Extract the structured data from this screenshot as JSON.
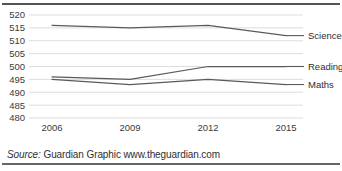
{
  "figure": {
    "source_prefix": "Source:",
    "source_text": "Guardian Graphic www.theguardian.com",
    "line_color": "#5a5a5a",
    "grid_color": "#d9d9d9",
    "rule_color": "#555555"
  },
  "chart_data": {
    "type": "line",
    "title": "",
    "subtitle": "",
    "xlabel": "",
    "ylabel": "",
    "x": [
      2006,
      2009,
      2012,
      2015
    ],
    "categories": [
      "2006",
      "2009",
      "2012",
      "2015"
    ],
    "ylim": [
      480,
      520
    ],
    "yticks": [
      480,
      485,
      490,
      495,
      500,
      505,
      510,
      515,
      520
    ],
    "ytick_labels": [
      "480",
      "485",
      "490",
      "495",
      "500",
      "505",
      "510",
      "515",
      "520"
    ],
    "xtick_labels": [
      "2006",
      "2009",
      "2012",
      "2015"
    ],
    "grid": "horizontal",
    "legend_position": "right-inline",
    "series": [
      {
        "name": "Science",
        "values": [
          516,
          515,
          516,
          512
        ]
      },
      {
        "name": "Reading",
        "values": [
          496,
          495,
          500,
          500
        ]
      },
      {
        "name": "Maths",
        "values": [
          495,
          493,
          495,
          493
        ]
      }
    ]
  }
}
